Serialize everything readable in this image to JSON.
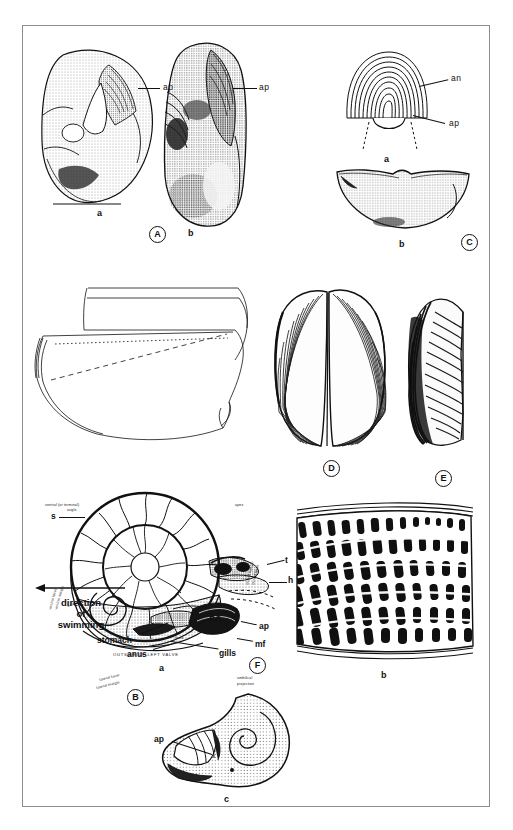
{
  "plate": {
    "caption_letters": [
      "A",
      "B",
      "C",
      "D",
      "E",
      "F"
    ],
    "background": "#ffffff",
    "ink": "#111111",
    "border_color": "#8c8c8c"
  },
  "figure_a": {
    "panel_letter": "A",
    "subfigures": [
      {
        "key": "a",
        "label": "a",
        "leader_label": "ap"
      },
      {
        "key": "b",
        "label": "b",
        "leader_label": "ap"
      }
    ]
  },
  "figure_c": {
    "panel_letter": "C",
    "subfigures": [
      {
        "key": "a",
        "label": "a",
        "leader_labels": [
          "an",
          "ap"
        ]
      },
      {
        "key": "b",
        "label": "b",
        "leader_labels": []
      }
    ]
  },
  "figure_b": {
    "panel_letter": "B",
    "labels": {
      "ventral_angle": "ventral (or terminal)\nangle",
      "ventral_angle_line1": "ventral (or terminal)",
      "ventral_angle_line2": "angle",
      "harmonic_margin": "harmonic margin (symphysis)",
      "harmonic_facet": "harmonic facet",
      "apex": "apex",
      "inside_right_valve": "INSIDE OF RIGHT VALVE",
      "adharmonic_ridge": "adharmonic ridge",
      "adharmonic_furrow": "adharmonic furrow",
      "adharmonic_slope": "adharmonic slope",
      "keel": "keel",
      "flank": "flank",
      "outside_left_valve": "OUTSIDE OF LEFT VALVE",
      "ventral_facet": "ventral facet",
      "ventral_margin": "ventral margin",
      "lateral_facet": "lateral facet",
      "lateral_margin": "lateral margin",
      "umbilical_projection_line1": "umbilical",
      "umbilical_projection_line2": "projection",
      "dorsal_margin": "dorsal margin",
      "dorsal_facet": "dorsal facet"
    }
  },
  "figure_d": {
    "panel_letter": "D"
  },
  "figure_e": {
    "panel_letter": "E"
  },
  "figure_f": {
    "panel_letter": "F",
    "subfigures": [
      {
        "key": "a",
        "label": "a"
      },
      {
        "key": "b",
        "label": "b"
      },
      {
        "key": "c",
        "label": "c",
        "leader_label": "ap"
      }
    ],
    "labels": {
      "s": "s",
      "t": "t",
      "h": "h",
      "bc": "BC",
      "ap": "ap",
      "mf": "mf",
      "gills": "gills",
      "anus": "anus",
      "stomach": "stomach",
      "direction_line1": "direction",
      "direction_line2": "of",
      "direction_line3": "swimming"
    }
  }
}
